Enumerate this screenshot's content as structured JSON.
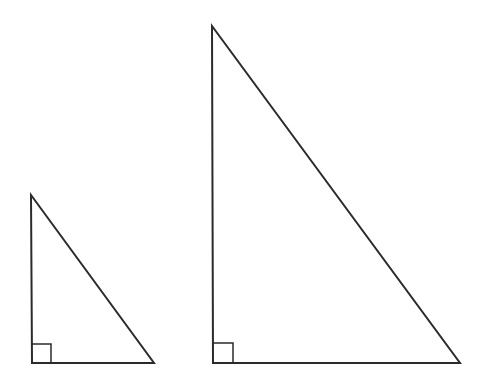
{
  "diagram": {
    "stroke_color": "#2b2b2b",
    "background": "#ffffff",
    "triangles": [
      {
        "id": "small",
        "vertices": {
          "top": [
            31,
            195
          ],
          "right_angle": [
            32,
            363
          ],
          "base_end": [
            154,
            363
          ]
        },
        "right_angle_marker_size": 19
      },
      {
        "id": "large",
        "vertices": {
          "top": [
            212,
            26
          ],
          "right_angle": [
            213,
            363
          ],
          "base_end": [
            460,
            363
          ]
        },
        "right_angle_marker_size": 20
      }
    ]
  }
}
